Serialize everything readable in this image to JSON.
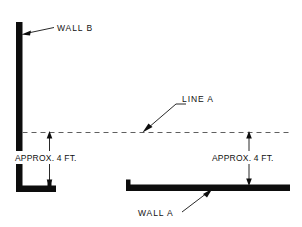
{
  "diagram": {
    "background_color": "#ffffff",
    "ink_color": "#0d0d0d",
    "reference_line_color": "#5f5f5f",
    "labels": {
      "wall_b": "WALL B",
      "wall_a": "WALL A",
      "line_a": "LINE A",
      "dimension_left": "APPROX. 4 FT.",
      "dimension_right": "APPROX. 4 FT."
    },
    "elements": {
      "wall_b": {
        "name": "WALL B",
        "orientation": "vertical",
        "description": "Tall vertical wall at left with horizontal footing at base"
      },
      "wall_a": {
        "name": "WALL A",
        "orientation": "horizontal",
        "description": "Low horizontal wall at right with end cap at left"
      },
      "line_a": {
        "name": "LINE A",
        "style": "dashed",
        "description": "Horizontal dashed reference line spanning the diagram"
      }
    },
    "dimensions": [
      {
        "label": "APPROX. 4 FT.",
        "side": "left",
        "from": "top of WALL B footing",
        "to": "LINE A",
        "value": 4,
        "unit": "FT."
      },
      {
        "label": "APPROX. 4 FT.",
        "side": "right",
        "from": "top of WALL A",
        "to": "LINE A",
        "value": 4,
        "unit": "FT."
      }
    ]
  }
}
